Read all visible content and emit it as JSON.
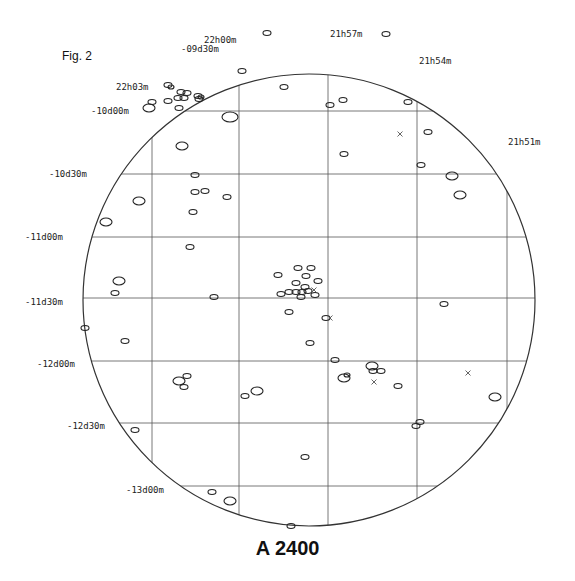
{
  "figure_label": "Fig. 2",
  "title": "A 2400",
  "field": {
    "center": [
      309,
      300
    ],
    "radius": 226
  },
  "grid": {
    "ra_lines_x": [
      152,
      239,
      328,
      417,
      507
    ],
    "dec_lines_y": [
      111,
      174,
      237,
      298,
      361,
      423,
      486
    ]
  },
  "ra_labels": [
    {
      "text": "22h03m",
      "x": 116,
      "y": 90
    },
    {
      "text": "22h00m",
      "x": 204,
      "y": 43
    },
    {
      "text": "21h57m",
      "x": 330,
      "y": 37
    },
    {
      "text": "21h54m",
      "x": 419,
      "y": 64
    },
    {
      "text": "21h51m",
      "x": 508,
      "y": 145
    }
  ],
  "dec_labels": [
    {
      "text": "-09d30m",
      "x": 181,
      "y": 49
    },
    {
      "text": "-10d00m",
      "x": 91,
      "y": 111
    },
    {
      "text": "-10d30m",
      "x": 49,
      "y": 174
    },
    {
      "text": "-11d00m",
      "x": 25,
      "y": 237
    },
    {
      "text": "-11d30m",
      "x": 25,
      "y": 302
    },
    {
      "text": "-12d00m",
      "x": 37,
      "y": 364
    },
    {
      "text": "-12d30m",
      "x": 67,
      "y": 426
    },
    {
      "text": "-13d00m",
      "x": 126,
      "y": 490
    }
  ],
  "chart_data": {
    "type": "scatter",
    "title": "A 2400",
    "subtitle": "Fig. 2",
    "xlabel": "Right Ascension",
    "ylabel": "Declination",
    "x_ticks": [
      "22h03m",
      "22h00m",
      "21h57m",
      "21h54m",
      "21h51m"
    ],
    "y_ticks": [
      "-09d30m",
      "-10d00m",
      "-10d30m",
      "-11d00m",
      "-11d30m",
      "-12d00m",
      "-12d30m",
      "-13d00m"
    ],
    "grid": true,
    "series": [
      {
        "name": "galaxies",
        "marker": "ellipse",
        "points": [
          [
            267,
            33,
            4,
            2.5
          ],
          [
            242,
            71,
            4,
            2.5
          ],
          [
            284,
            87,
            4,
            2.5
          ],
          [
            386,
            34,
            4,
            2.5
          ],
          [
            330,
            105,
            4,
            2.5
          ],
          [
            343,
            100,
            4,
            2.5
          ],
          [
            408,
            102,
            4,
            2.5
          ],
          [
            428,
            132,
            4,
            2.5
          ],
          [
            421,
            165,
            4,
            2.5
          ],
          [
            344,
            154,
            4,
            2.5
          ],
          [
            168,
            85,
            4,
            2.5
          ],
          [
            171,
            87,
            3,
            2
          ],
          [
            181,
            92,
            4,
            2.5
          ],
          [
            187,
            93,
            4,
            2.5
          ],
          [
            168,
            101,
            4,
            2.5
          ],
          [
            178,
            98,
            4,
            2.5
          ],
          [
            184,
            98,
            4,
            2.5
          ],
          [
            198,
            96,
            4,
            2.5
          ],
          [
            199,
            99,
            4,
            2.5
          ],
          [
            201,
            97,
            3,
            2
          ],
          [
            152,
            102,
            4,
            2.5
          ],
          [
            149,
            108,
            6,
            4
          ],
          [
            179,
            108,
            4,
            2.5
          ],
          [
            230,
            117,
            8,
            5
          ],
          [
            182,
            146,
            6,
            4
          ],
          [
            139,
            201,
            6,
            4
          ],
          [
            106,
            222,
            6,
            4
          ],
          [
            195,
            175,
            4,
            2.5
          ],
          [
            195,
            192,
            4,
            2.5
          ],
          [
            205,
            191,
            4,
            2.5
          ],
          [
            227,
            197,
            4,
            2.5
          ],
          [
            193,
            212,
            4,
            2.5
          ],
          [
            190,
            247,
            4,
            2.5
          ],
          [
            452,
            176,
            6,
            4
          ],
          [
            460,
            195,
            6,
            4
          ],
          [
            119,
            281,
            6,
            4
          ],
          [
            115,
            293,
            4,
            2.5
          ],
          [
            214,
            297,
            4,
            2.5
          ],
          [
            85,
            328,
            4,
            2.5
          ],
          [
            125,
            341,
            4,
            2.5
          ],
          [
            278,
            275,
            4,
            2.5
          ],
          [
            298,
            268,
            4,
            2.5
          ],
          [
            311,
            268,
            4,
            2.5
          ],
          [
            306,
            276,
            4,
            2.5
          ],
          [
            318,
            281,
            4,
            2.5
          ],
          [
            296,
            283,
            4,
            2.5
          ],
          [
            305,
            287,
            4,
            2.5
          ],
          [
            302,
            292,
            4,
            2.5
          ],
          [
            296,
            292,
            4,
            2.5
          ],
          [
            308,
            291,
            4,
            2.5
          ],
          [
            315,
            295,
            4,
            2.5
          ],
          [
            289,
            292,
            4,
            2.5
          ],
          [
            281,
            294,
            4,
            2.5
          ],
          [
            301,
            297,
            4,
            2.5
          ],
          [
            289,
            312,
            4,
            2.5
          ],
          [
            326,
            318,
            4,
            2.5
          ],
          [
            310,
            343,
            4,
            2.5
          ],
          [
            444,
            304,
            4,
            2.5
          ],
          [
            335,
            360,
            4,
            2.5
          ],
          [
            372,
            366,
            6,
            4
          ],
          [
            373,
            371,
            4,
            2.5
          ],
          [
            381,
            371,
            4,
            2.5
          ],
          [
            344,
            378,
            6,
            4
          ],
          [
            347,
            375,
            3,
            2
          ],
          [
            398,
            386,
            4,
            2.5
          ],
          [
            495,
            397,
            6,
            4
          ],
          [
            179,
            381,
            6,
            4
          ],
          [
            187,
            376,
            4,
            2.5
          ],
          [
            184,
            387,
            4,
            2.5
          ],
          [
            245,
            396,
            4,
            2.5
          ],
          [
            257,
            391,
            6,
            4
          ],
          [
            135,
            430,
            4,
            2.5
          ],
          [
            420,
            422,
            4,
            2.5
          ],
          [
            416,
            426,
            4,
            2.5
          ],
          [
            305,
            457,
            4,
            2.5
          ],
          [
            212,
            492,
            4,
            2.5
          ],
          [
            230,
            501,
            6,
            4
          ],
          [
            291,
            526,
            4,
            2.5
          ]
        ]
      },
      {
        "name": "crosses",
        "marker": "x",
        "points": [
          [
            400,
            134
          ],
          [
            330,
            318
          ],
          [
            374,
            382
          ],
          [
            468,
            373
          ],
          [
            314,
            290
          ]
        ]
      }
    ]
  }
}
